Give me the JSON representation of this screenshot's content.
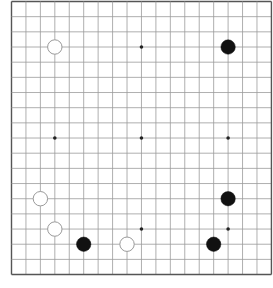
{
  "board": {
    "size": 19,
    "origin": {
      "x": 11.5,
      "y": 1.5
    },
    "spacing": {
      "x": 14.44,
      "y": 15.17
    },
    "line_color": "#9a9a9a",
    "border_color": "#555555",
    "background": "#ffffff",
    "star_points": [
      [
        3,
        3
      ],
      [
        9,
        3
      ],
      [
        15,
        3
      ],
      [
        3,
        9
      ],
      [
        9,
        9
      ],
      [
        15,
        9
      ],
      [
        3,
        15
      ],
      [
        9,
        15
      ],
      [
        15,
        15
      ]
    ],
    "stone_radius": 7.2
  },
  "stones": [
    {
      "color": "white",
      "col": 3,
      "row": 3
    },
    {
      "color": "black",
      "col": 15,
      "row": 3
    },
    {
      "color": "white",
      "col": 2,
      "row": 13
    },
    {
      "color": "black",
      "col": 15,
      "row": 13
    },
    {
      "color": "white",
      "col": 3,
      "row": 15
    },
    {
      "color": "black",
      "col": 5,
      "row": 16
    },
    {
      "color": "white",
      "col": 8,
      "row": 16
    },
    {
      "color": "black",
      "col": 14,
      "row": 16
    }
  ],
  "colors": {
    "black_stone": "#111111",
    "white_stone_fill": "#ffffff",
    "white_stone_stroke": "#9a9a9a",
    "star": "#222222"
  }
}
